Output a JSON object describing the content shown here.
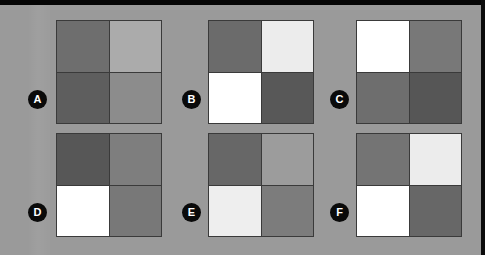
{
  "canvas": {
    "width": 485,
    "height": 255,
    "background_color": "#9a9a9a",
    "letterbox_color": "#050505"
  },
  "style": {
    "grid_line_color": "#3a3a3a",
    "badge_fill_color": "#0a0a0a",
    "badge_text_color": "#ffffff"
  },
  "panels": [
    {
      "label": "A",
      "badge": {
        "x": 28,
        "y": 90
      },
      "frame": {
        "x": 56,
        "y": 20,
        "width": 106,
        "height": 104
      },
      "cells": [
        {
          "position": "top-left",
          "color": "#6e6e6e"
        },
        {
          "position": "top-right",
          "color": "#ababab"
        },
        {
          "position": "bottom-left",
          "color": "#5e5e5e"
        },
        {
          "position": "bottom-right",
          "color": "#8c8c8c"
        }
      ]
    },
    {
      "label": "B",
      "badge": {
        "x": 182,
        "y": 90
      },
      "frame": {
        "x": 208,
        "y": 20,
        "width": 106,
        "height": 104
      },
      "cells": [
        {
          "position": "top-left",
          "color": "#6b6b6b"
        },
        {
          "position": "top-right",
          "color": "#ececec"
        },
        {
          "position": "bottom-left",
          "color": "#ffffff"
        },
        {
          "position": "bottom-right",
          "color": "#585858"
        }
      ]
    },
    {
      "label": "C",
      "badge": {
        "x": 330,
        "y": 90
      },
      "frame": {
        "x": 356,
        "y": 20,
        "width": 106,
        "height": 104
      },
      "cells": [
        {
          "position": "top-left",
          "color": "#ffffff"
        },
        {
          "position": "top-right",
          "color": "#787878"
        },
        {
          "position": "bottom-left",
          "color": "#6e6e6e"
        },
        {
          "position": "bottom-right",
          "color": "#565656"
        }
      ]
    },
    {
      "label": "D",
      "badge": {
        "x": 28,
        "y": 203
      },
      "frame": {
        "x": 56,
        "y": 133,
        "width": 106,
        "height": 104
      },
      "cells": [
        {
          "position": "top-left",
          "color": "#575757"
        },
        {
          "position": "top-right",
          "color": "#7e7e7e"
        },
        {
          "position": "bottom-left",
          "color": "#ffffff"
        },
        {
          "position": "bottom-right",
          "color": "#787878"
        }
      ]
    },
    {
      "label": "E",
      "badge": {
        "x": 182,
        "y": 203
      },
      "frame": {
        "x": 208,
        "y": 133,
        "width": 106,
        "height": 104
      },
      "cells": [
        {
          "position": "top-left",
          "color": "#676767"
        },
        {
          "position": "top-right",
          "color": "#9c9c9c"
        },
        {
          "position": "bottom-left",
          "color": "#eeeeee"
        },
        {
          "position": "bottom-right",
          "color": "#7c7c7c"
        }
      ]
    },
    {
      "label": "F",
      "badge": {
        "x": 330,
        "y": 203
      },
      "frame": {
        "x": 356,
        "y": 133,
        "width": 106,
        "height": 104
      },
      "cells": [
        {
          "position": "top-left",
          "color": "#747474"
        },
        {
          "position": "top-right",
          "color": "#ececec"
        },
        {
          "position": "bottom-left",
          "color": "#ffffff"
        },
        {
          "position": "bottom-right",
          "color": "#676767"
        }
      ]
    }
  ]
}
